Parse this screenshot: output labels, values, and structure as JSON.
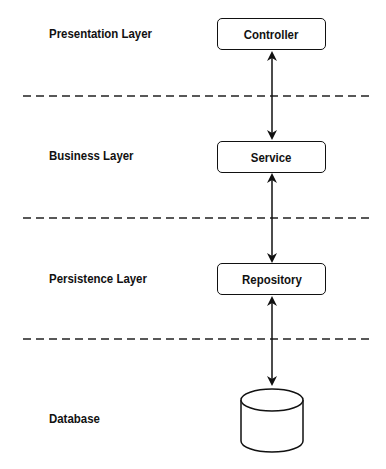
{
  "diagram": {
    "layers": [
      {
        "label": "Presentation Layer",
        "component": "Controller"
      },
      {
        "label": "Business Layer",
        "component": "Service"
      },
      {
        "label": "Persistence Layer",
        "component": "Repository"
      },
      {
        "label": "Database",
        "component": "database-cylinder"
      }
    ],
    "connections": [
      {
        "from": "Controller",
        "to": "Service",
        "type": "bidirectional-arrow"
      },
      {
        "from": "Service",
        "to": "Repository",
        "type": "bidirectional-arrow"
      },
      {
        "from": "Repository",
        "to": "Database",
        "type": "bidirectional-arrow"
      }
    ],
    "separators": 3,
    "colors": {
      "stroke": "#111111",
      "background": "#ffffff"
    }
  }
}
